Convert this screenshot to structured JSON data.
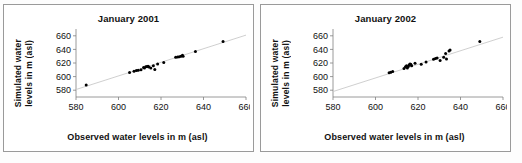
{
  "figure": {
    "panel_count": 2,
    "background_color": "#ffffff",
    "border_color": "#9a9a9a",
    "marker_color": "#000000",
    "trendline_color": "#c9c9c9",
    "axis_color": "#808080"
  },
  "chart_data": [
    {
      "type": "scatter",
      "title": "January 2001",
      "xlabel": "Observed water levels in m (asl)",
      "ylabel": "Simulated water levels in m (asl)",
      "ylabel_line1": "Simulated water",
      "ylabel_line2": "levels in m (asl)",
      "xlim": [
        580,
        660
      ],
      "ylim": [
        570,
        670
      ],
      "xticks": [
        580,
        600,
        620,
        640,
        660
      ],
      "yticks": [
        580,
        600,
        620,
        640,
        660
      ],
      "grid": false,
      "legend": "none",
      "trendline": {
        "x": [
          580,
          660
        ],
        "y": [
          581,
          661
        ]
      },
      "points": [
        {
          "x": 584.8,
          "y": 587.5
        },
        {
          "x": 605.2,
          "y": 606.2
        },
        {
          "x": 607.3,
          "y": 608.0
        },
        {
          "x": 608.4,
          "y": 609.0
        },
        {
          "x": 609.3,
          "y": 609.5
        },
        {
          "x": 610.6,
          "y": 610.0
        },
        {
          "x": 611.8,
          "y": 613.5
        },
        {
          "x": 612.2,
          "y": 612.5
        },
        {
          "x": 612.8,
          "y": 614.5
        },
        {
          "x": 613.4,
          "y": 615.0
        },
        {
          "x": 613.9,
          "y": 615.3
        },
        {
          "x": 614.3,
          "y": 614.0
        },
        {
          "x": 615.2,
          "y": 612.5
        },
        {
          "x": 616.4,
          "y": 615.8
        },
        {
          "x": 617.1,
          "y": 610.5
        },
        {
          "x": 618.4,
          "y": 618.5
        },
        {
          "x": 621.3,
          "y": 620.8
        },
        {
          "x": 626.9,
          "y": 628.5
        },
        {
          "x": 627.8,
          "y": 629.0
        },
        {
          "x": 628.6,
          "y": 629.3
        },
        {
          "x": 629.4,
          "y": 630.0
        },
        {
          "x": 630.1,
          "y": 631.5
        },
        {
          "x": 630.4,
          "y": 629.8
        },
        {
          "x": 636.2,
          "y": 637.0
        },
        {
          "x": 649.2,
          "y": 651.5
        }
      ]
    },
    {
      "type": "scatter",
      "title": "January 2002",
      "xlabel": "Observed water levels in m (asl)",
      "ylabel": "Simulated water levels in m (asl)",
      "ylabel_line1": "Simulated water",
      "ylabel_line2": "levels in m (asl)",
      "xlim": [
        580,
        660
      ],
      "ylim": [
        570,
        670
      ],
      "xticks": [
        580,
        600,
        620,
        640,
        660
      ],
      "yticks": [
        580,
        600,
        620,
        640,
        660
      ],
      "grid": false,
      "legend": "none",
      "trendline": {
        "x": [
          580,
          660
        ],
        "y": [
          578,
          658
        ]
      },
      "points": [
        {
          "x": 606.4,
          "y": 605.5
        },
        {
          "x": 607.2,
          "y": 606.5
        },
        {
          "x": 608.1,
          "y": 607.5
        },
        {
          "x": 613.4,
          "y": 612.0
        },
        {
          "x": 614.1,
          "y": 614.5
        },
        {
          "x": 614.6,
          "y": 616.0
        },
        {
          "x": 615.0,
          "y": 612.5
        },
        {
          "x": 615.4,
          "y": 615.0
        },
        {
          "x": 615.8,
          "y": 617.0
        },
        {
          "x": 616.2,
          "y": 618.5
        },
        {
          "x": 616.6,
          "y": 618.2
        },
        {
          "x": 617.0,
          "y": 616.0
        },
        {
          "x": 618.6,
          "y": 619.5
        },
        {
          "x": 621.5,
          "y": 618.0
        },
        {
          "x": 623.8,
          "y": 621.5
        },
        {
          "x": 627.3,
          "y": 625.5
        },
        {
          "x": 628.2,
          "y": 626.5
        },
        {
          "x": 629.0,
          "y": 627.5
        },
        {
          "x": 630.4,
          "y": 623.5
        },
        {
          "x": 632.1,
          "y": 628.5
        },
        {
          "x": 633.0,
          "y": 634.0
        },
        {
          "x": 633.4,
          "y": 626.0
        },
        {
          "x": 634.6,
          "y": 637.5
        },
        {
          "x": 635.1,
          "y": 639.0
        },
        {
          "x": 649.1,
          "y": 651.5
        }
      ]
    }
  ]
}
